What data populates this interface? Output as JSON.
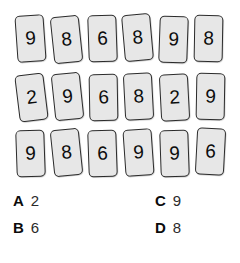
{
  "puzzle": {
    "type": "number-cards-grid",
    "colors": {
      "card_fill": "#e7e7e7",
      "card_border": "#2b2b2b",
      "digit": "#0d0d0d",
      "option_letter": "#0b0b0b",
      "option_value": "#2a2a2a",
      "background": "#ffffff"
    },
    "grid": {
      "rows": 3,
      "columns": 6,
      "cards": [
        [
          {
            "digit": "9",
            "rotation": -4,
            "x": 16,
            "y": 2
          },
          {
            "digit": "8",
            "rotation": -6,
            "x": 52,
            "y": 3
          },
          {
            "digit": "6",
            "rotation": -2,
            "x": 88,
            "y": 2
          },
          {
            "digit": "8",
            "rotation": -5,
            "x": 123,
            "y": 1
          },
          {
            "digit": "9",
            "rotation": 2,
            "x": 159,
            "y": 3
          },
          {
            "digit": "8",
            "rotation": 1,
            "x": 194,
            "y": 2
          }
        ],
        [
          {
            "digit": "2",
            "rotation": -7,
            "x": 17,
            "y": 3
          },
          {
            "digit": "9",
            "rotation": -6,
            "x": 53,
            "y": 2
          },
          {
            "digit": "6",
            "rotation": -1,
            "x": 89,
            "y": 3
          },
          {
            "digit": "8",
            "rotation": -3,
            "x": 124,
            "y": 2
          },
          {
            "digit": "2",
            "rotation": -3,
            "x": 160,
            "y": 3
          },
          {
            "digit": "9",
            "rotation": 1,
            "x": 196,
            "y": 2
          }
        ],
        [
          {
            "digit": "9",
            "rotation": -2,
            "x": 16,
            "y": 3
          },
          {
            "digit": "8",
            "rotation": -6,
            "x": 52,
            "y": 2
          },
          {
            "digit": "6",
            "rotation": -2,
            "x": 88,
            "y": 3
          },
          {
            "digit": "9",
            "rotation": -4,
            "x": 124,
            "y": 2
          },
          {
            "digit": "9",
            "rotation": -2,
            "x": 160,
            "y": 3
          },
          {
            "digit": "6",
            "rotation": 3,
            "x": 196,
            "y": 1
          }
        ]
      ]
    },
    "options": [
      {
        "letter": "A",
        "value": "2",
        "column": "left",
        "row": 0
      },
      {
        "letter": "B",
        "value": "6",
        "column": "left",
        "row": 1
      },
      {
        "letter": "C",
        "value": "9",
        "column": "right",
        "row": 0
      },
      {
        "letter": "D",
        "value": "8",
        "column": "right",
        "row": 1
      }
    ]
  }
}
